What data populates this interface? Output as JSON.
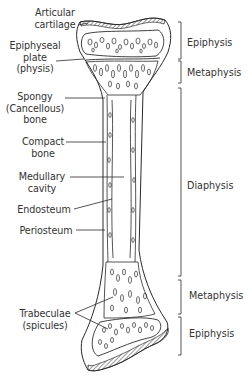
{
  "diagram": {
    "type": "anatomical",
    "left_labels": [
      {
        "id": "articular-cartilage",
        "lines": [
          "Articular",
          "cartilage"
        ]
      },
      {
        "id": "epiphyseal-plate",
        "lines": [
          "Epiphyseal",
          "plate",
          "(physis)"
        ]
      },
      {
        "id": "spongy-bone",
        "lines": [
          "Spongy",
          "(Cancellous)",
          "bone"
        ]
      },
      {
        "id": "compact-bone",
        "lines": [
          "Compact",
          "bone"
        ]
      },
      {
        "id": "medullary-cavity",
        "lines": [
          "Medullary",
          "cavity"
        ]
      },
      {
        "id": "endosteum",
        "lines": [
          "Endosteum"
        ]
      },
      {
        "id": "periosteum",
        "lines": [
          "Periosteum"
        ]
      },
      {
        "id": "trabeculae",
        "lines": [
          "Trabeculae",
          "(spicules)"
        ]
      }
    ],
    "right_regions": [
      {
        "label": "Epiphysis",
        "y_start": 22,
        "y_end": 59
      },
      {
        "label": "Metaphysis",
        "y_start": 61,
        "y_end": 83
      },
      {
        "label": "Diaphysis",
        "y_start": 88,
        "y_end": 276
      },
      {
        "label": "Metaphysis",
        "y_start": 280,
        "y_end": 314
      },
      {
        "label": "Epiphysis",
        "y_start": 317,
        "y_end": 355
      }
    ],
    "colors": {
      "line": "#2a2a2a",
      "text": "#333333",
      "background": "#ffffff"
    }
  }
}
